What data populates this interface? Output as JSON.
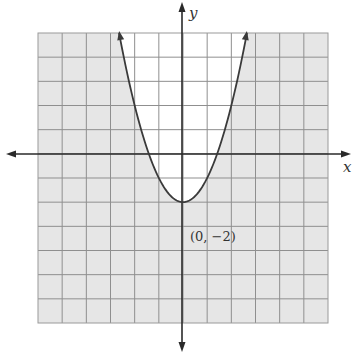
{
  "chart_data": {
    "type": "line",
    "title": "",
    "xlabel": "x",
    "ylabel": "y",
    "xlim": [
      -6,
      6
    ],
    "ylim": [
      -7,
      5
    ],
    "grid": true,
    "legend": null,
    "series": [
      {
        "name": "boundary",
        "equation": "y = x^2 - 2",
        "style": "solid",
        "x": [
          -2.65,
          -2,
          -1,
          0,
          1,
          2,
          2.65
        ],
        "y": [
          5,
          2,
          -1,
          -2,
          -1,
          2,
          5
        ]
      }
    ],
    "shaded_region": "outside parabola (y < x^2 - 2)",
    "annotations": [
      {
        "text": "(0, −2)",
        "x": 0,
        "y": -2
      }
    ],
    "colors": {
      "shade": "#e6e6e6",
      "unshaded": "#ffffff",
      "grid": "#8a8a8a",
      "axis": "#2a2a2a",
      "curve": "#3a3a3a"
    }
  },
  "labels": {
    "x_axis": "x",
    "y_axis": "y",
    "vertex": "(0, −2)"
  }
}
